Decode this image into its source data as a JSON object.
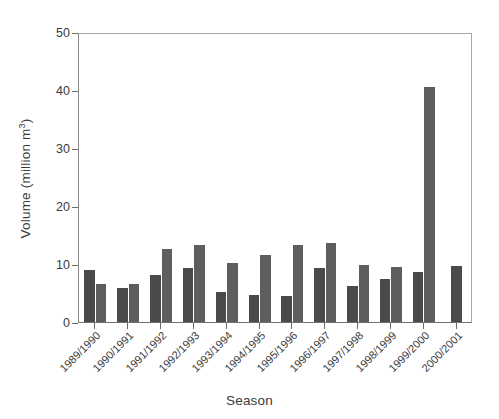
{
  "chart_data": {
    "type": "bar",
    "title": "",
    "subtitle": "",
    "xlabel": "Season",
    "ylabel": "Volume (million m",
    "ylabel_sup": "3",
    "ylabel_suffix": ")",
    "ylabel_full": "Volume (million m3)",
    "categories": [
      "1989/1990",
      "1990/1991",
      "1991/1992",
      "1992/1993",
      "1993/1994",
      "1994/1995",
      "1995/1996",
      "1996/1997",
      "1997/1998",
      "1998/1999",
      "1999/2000",
      "2000/2001"
    ],
    "series": [
      {
        "name": "Series 1",
        "color": "#4a4a4a",
        "values": [
          9.0,
          5.9,
          8.1,
          9.3,
          5.1,
          4.7,
          4.4,
          9.3,
          6.2,
          7.5,
          8.7,
          9.7
        ]
      },
      {
        "name": "Series 2",
        "color": "#5e5e5e",
        "values": [
          6.5,
          6.5,
          12.6,
          13.3,
          10.2,
          11.6,
          13.2,
          13.6,
          9.8,
          9.4,
          40.5,
          null
        ]
      }
    ],
    "ylim": [
      0,
      50
    ],
    "yticks": [
      0,
      10,
      20,
      30,
      40,
      50
    ],
    "ytick_labels": [
      "0",
      "10",
      "20",
      "30",
      "40",
      "50"
    ],
    "grid": false,
    "legend": "none",
    "xtick_rotation": -45
  },
  "figure": {
    "background_color": "#ffffff",
    "axis_color": "#9a9a9a",
    "text_color": "#3b3b3b"
  }
}
